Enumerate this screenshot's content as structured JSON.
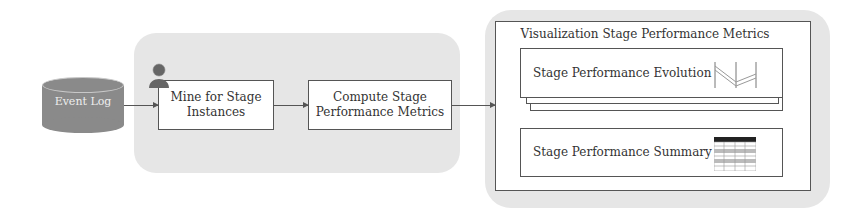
{
  "diagram": {
    "type": "pipeline-flow",
    "nodes": {
      "event_log": {
        "label": "Event Log",
        "shape": "database-cylinder"
      },
      "mine": {
        "label": "Mine for Stage\nInstances",
        "icon": "user-icon"
      },
      "compute": {
        "label": "Compute Stage\nPerformance Metrics"
      },
      "viz": {
        "title": "Visualization Stage Performance Metrics",
        "evolution": {
          "label": "Stage Performance Evolution",
          "icon": "line-chart-icon",
          "stacked": true
        },
        "summary": {
          "label": "Stage Performance Summary",
          "icon": "table-icon"
        }
      }
    },
    "edges": [
      {
        "from": "Event Log",
        "to": "Mine for Stage Instances"
      },
      {
        "from": "Mine for Stage Instances",
        "to": "Compute Stage Performance Metrics"
      },
      {
        "from": "Compute Stage Performance Metrics",
        "to": "Visualization Stage Performance Metrics"
      }
    ],
    "colors": {
      "group_bg": "#e6e6e6",
      "db_fill": "#8a8a8a",
      "stroke": "#555555"
    }
  }
}
